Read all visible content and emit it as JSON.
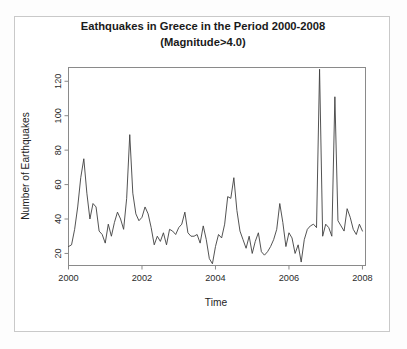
{
  "figure": {
    "background_color": "#ffffff",
    "frame_color": "#c9c9c9"
  },
  "chart_data": {
    "type": "line",
    "title": "Eathquakes in Greece in the Period 2000-2008",
    "subtitle": "(Magnitude>4.0)",
    "xlabel": "Time",
    "ylabel": "Number of Earthquakes",
    "xlim": [
      2000.0,
      2008.083
    ],
    "ylim": [
      13,
      128
    ],
    "xticks": [
      2000,
      2002,
      2004,
      2006,
      2008
    ],
    "xtick_labels": [
      "2000",
      "2002",
      "2004",
      "2006",
      "2008"
    ],
    "yticks": [
      20,
      40,
      60,
      80,
      100,
      120
    ],
    "ytick_labels": [
      "20",
      "40",
      "60",
      "80",
      "100",
      "120"
    ],
    "grid": false,
    "legend": false,
    "line_color": "#404040",
    "line_width": 0.9,
    "series_name": "Monthly earthquake count",
    "frequency": "monthly",
    "x": [
      2000.0,
      2000.083,
      2000.167,
      2000.25,
      2000.333,
      2000.417,
      2000.5,
      2000.583,
      2000.667,
      2000.75,
      2000.833,
      2000.917,
      2001.0,
      2001.083,
      2001.167,
      2001.25,
      2001.333,
      2001.417,
      2001.5,
      2001.583,
      2001.667,
      2001.75,
      2001.833,
      2001.917,
      2002.0,
      2002.083,
      2002.167,
      2002.25,
      2002.333,
      2002.417,
      2002.5,
      2002.583,
      2002.667,
      2002.75,
      2002.833,
      2002.917,
      2003.0,
      2003.083,
      2003.167,
      2003.25,
      2003.333,
      2003.417,
      2003.5,
      2003.583,
      2003.667,
      2003.75,
      2003.833,
      2003.917,
      2004.0,
      2004.083,
      2004.167,
      2004.25,
      2004.333,
      2004.417,
      2004.5,
      2004.583,
      2004.667,
      2004.75,
      2004.833,
      2004.917,
      2005.0,
      2005.083,
      2005.167,
      2005.25,
      2005.333,
      2005.417,
      2005.5,
      2005.583,
      2005.667,
      2005.75,
      2005.833,
      2005.917,
      2006.0,
      2006.083,
      2006.167,
      2006.25,
      2006.333,
      2006.417,
      2006.5,
      2006.583,
      2006.667,
      2006.75,
      2006.833,
      2006.917,
      2007.0,
      2007.083,
      2007.167,
      2007.25,
      2007.333,
      2007.417,
      2007.5,
      2007.583,
      2007.667,
      2007.75,
      2007.833,
      2007.917,
      2008.0
    ],
    "values": [
      24,
      25,
      34,
      47,
      64,
      75,
      55,
      40,
      49,
      47,
      33,
      31,
      26,
      37,
      30,
      38,
      44,
      40,
      34,
      52,
      89,
      55,
      43,
      39,
      41,
      47,
      43,
      35,
      25,
      30,
      27,
      32,
      25,
      34,
      33,
      31,
      35,
      37,
      44,
      32,
      30,
      30,
      31,
      26,
      36,
      28,
      17,
      14,
      24,
      31,
      29,
      37,
      53,
      52,
      64,
      45,
      33,
      28,
      23,
      30,
      20,
      27,
      32,
      21,
      19,
      21,
      24,
      28,
      34,
      49,
      38,
      24,
      32,
      29,
      20,
      25,
      15,
      28,
      34,
      36,
      37,
      35,
      127,
      30,
      37,
      35,
      30,
      111,
      39,
      36,
      33,
      46,
      41,
      34,
      31,
      37,
      33
    ],
    "peaks": [
      {
        "x": 2000.417,
        "y": 75,
        "label": "mid-2000 peak"
      },
      {
        "x": 2001.667,
        "y": 89,
        "label": "mid-2001 peak"
      },
      {
        "x": 2004.5,
        "y": 64,
        "label": "late-2003 peak"
      },
      {
        "x": 2006.833,
        "y": 127,
        "label": "late-2005 maximum"
      },
      {
        "x": 2007.25,
        "y": 111,
        "label": "2006 peak"
      },
      {
        "x": 2007.583,
        "y": 83,
        "label": "2007 peak"
      }
    ]
  },
  "tail_values": [
    30,
    30,
    33,
    83,
    46,
    40,
    42,
    45,
    35,
    38,
    46,
    38,
    33,
    31
  ]
}
